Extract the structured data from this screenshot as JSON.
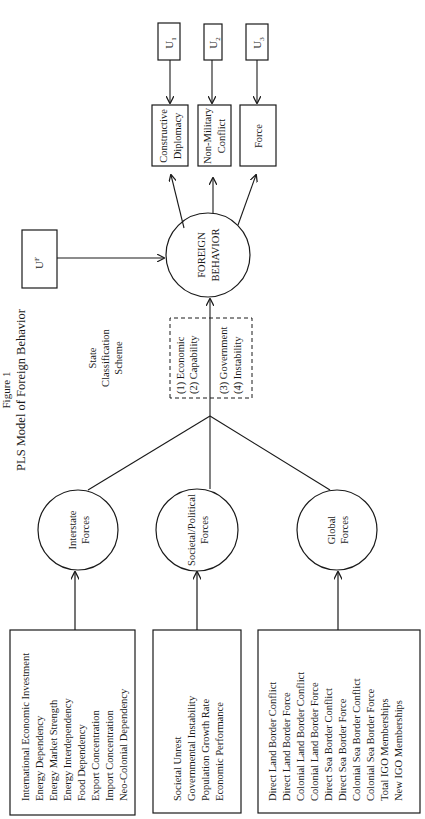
{
  "title": {
    "figure_label": "Figure 1",
    "caption": "PLS Model of Foreign Behavior"
  },
  "inputs": [
    {
      "id": "interstate",
      "items": [
        "International Economic Investment",
        "Energy Dependency",
        "Energy Market Strength",
        "Energy Interdependency",
        "Food Dependency",
        "Export Concentration",
        "Import Concentration",
        "Neo-Colonial Dependency"
      ]
    },
    {
      "id": "societal",
      "items": [
        "Societal Unrest",
        "Governmental Instability",
        "Population Growth Rate",
        "Economic Performance"
      ]
    },
    {
      "id": "global",
      "items": [
        "Direct Land Border Conflict",
        "Direct Land Border Force",
        "Colonial Land Border Conflict",
        "Colonial Land Border Force",
        "Direct Sea Border Conflict",
        "Direct Sea Border Force",
        "Colonial Sea Border Conflict",
        "Colonial Sea Border Force",
        "Total IGO Memberships",
        "New IGO Memberships"
      ]
    }
  ],
  "latent": {
    "interstate": [
      "Interstate",
      "Forces"
    ],
    "societal": [
      "Societal/Political",
      "Forces"
    ],
    "global": [
      "Global",
      "Forces"
    ]
  },
  "classification": {
    "heading": [
      "State",
      "Classification",
      "Scheme"
    ],
    "items": [
      "(1)  Economic",
      "(2)  Capability",
      "(3)  Government",
      "(4)  Instability"
    ]
  },
  "outcome": [
    "FOREIGN",
    "BEHAVIOR"
  ],
  "error_terms": {
    "foreign": {
      "base": "U",
      "sup": "F"
    },
    "outputs": [
      {
        "base": "U",
        "sub": "1"
      },
      {
        "base": "U",
        "sub": "2"
      },
      {
        "base": "U",
        "sub": "3"
      }
    ]
  },
  "behaviors": [
    [
      "Constructive",
      "Diplomacy"
    ],
    [
      "Non-Military",
      "Conflict"
    ],
    [
      "Force"
    ]
  ]
}
